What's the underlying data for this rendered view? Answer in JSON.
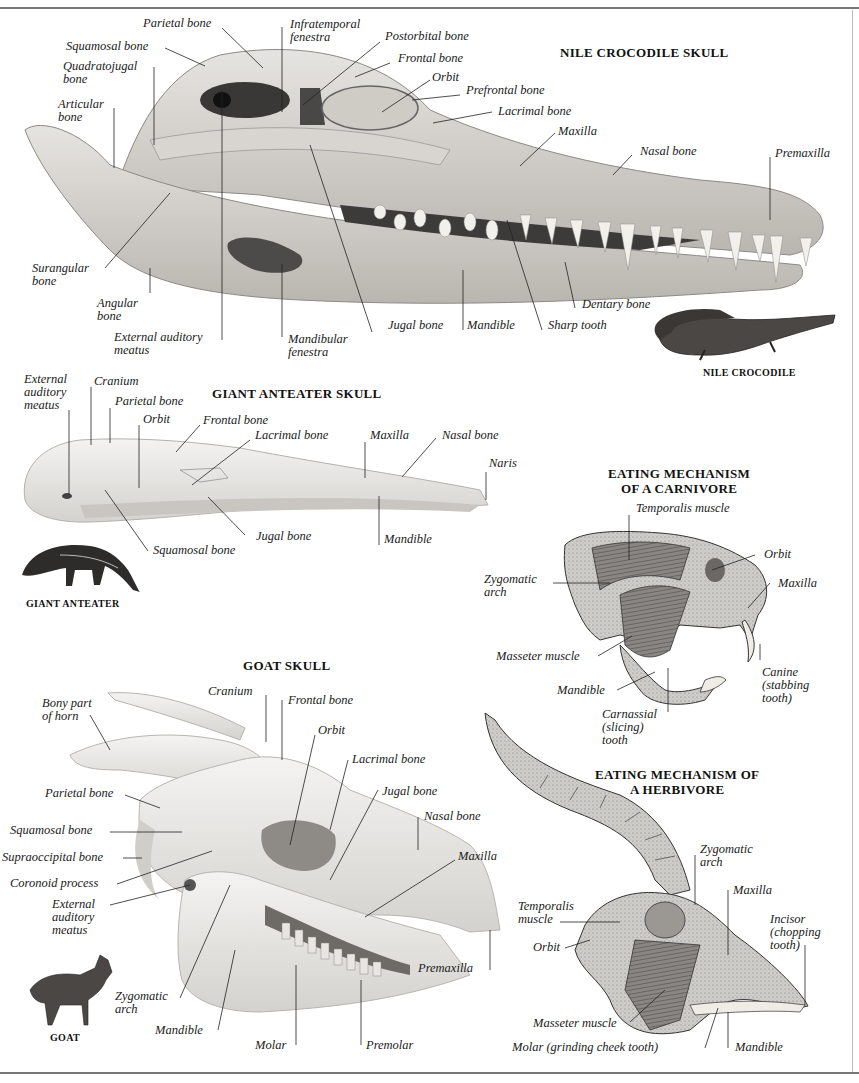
{
  "sections": {
    "crocodile": {
      "title": "NILE CROCODILE SKULL",
      "caption": "NILE CROCODILE",
      "labels": {
        "parietal": "Parietal bone",
        "squamosal": "Squamosal bone",
        "quadratojugal": "Quadratojugal\nbone",
        "articular": "Articular\nbone",
        "infratemporal": "Infratemporal\nfenestra",
        "postorbital": "Postorbital bone",
        "frontal": "Frontal bone",
        "orbit": "Orbit",
        "prefrontal": "Prefrontal bone",
        "lacrimal": "Lacrimal bone",
        "maxilla": "Maxilla",
        "nasal": "Nasal bone",
        "premaxilla": "Premaxilla",
        "surangular": "Surangular\nbone",
        "angular": "Angular\nbone",
        "ext_auditory": "External auditory\nmeatus",
        "mandibular_fenestra": "Mandibular\nfenestra",
        "jugal": "Jugal bone",
        "mandible": "Mandible",
        "sharp_tooth": "Sharp tooth",
        "dentary": "Dentary bone"
      }
    },
    "anteater": {
      "title": "GIANT ANTEATER SKULL",
      "caption": "GIANT ANTEATER",
      "labels": {
        "ext_auditory": "External\nauditory\nmeatus",
        "cranium": "Cranium",
        "parietal": "Parietal bone",
        "orbit": "Orbit",
        "frontal": "Frontal bone",
        "lacrimal": "Lacrimal bone",
        "maxilla": "Maxilla",
        "nasal": "Nasal bone",
        "naris": "Naris",
        "jugal": "Jugal bone",
        "squamosal": "Squamosal bone",
        "mandible": "Mandible"
      }
    },
    "carnivore": {
      "title": "EATING MECHANISM\nOF A CARNIVORE",
      "labels": {
        "temporalis": "Temporalis muscle",
        "orbit": "Orbit",
        "zygomatic": "Zygomatic\narch",
        "maxilla": "Maxilla",
        "masseter": "Masseter muscle",
        "mandible": "Mandible",
        "canine": "Canine\n(stabbing\ntooth)",
        "carnassial": "Carnassial\n(slicing)\ntooth"
      }
    },
    "goat": {
      "title": "GOAT SKULL",
      "caption": "GOAT",
      "labels": {
        "horn": "Bony part\nof horn",
        "cranium": "Cranium",
        "frontal": "Frontal bone",
        "orbit": "Orbit",
        "lacrimal": "Lacrimal bone",
        "parietal": "Parietal bone",
        "jugal": "Jugal bone",
        "squamosal": "Squamosal bone",
        "nasal": "Nasal bone",
        "supraoccipital": "Supraoccipital bone",
        "maxilla": "Maxilla",
        "coronoid": "Coronoid process",
        "ext_auditory": "External\nauditory\nmeatus",
        "premaxilla": "Premaxilla",
        "zygomatic": "Zygomatic\narch",
        "mandible": "Mandible",
        "molar": "Molar",
        "premolar": "Premolar"
      }
    },
    "herbivore": {
      "title": "EATING MECHANISM OF\nA HERBIVORE",
      "labels": {
        "zygomatic": "Zygomatic\narch",
        "maxilla": "Maxilla",
        "temporalis": "Temporalis\nmuscle",
        "incisor": "Incisor\n(chopping\ntooth)",
        "orbit": "Orbit",
        "masseter": "Masseter muscle",
        "molar": "Molar (grinding cheek tooth)",
        "mandible": "Mandible"
      }
    }
  },
  "colors": {
    "bone": "#dcdad6",
    "bone_dark": "#a9a6a0",
    "ink": "#1a1a1a",
    "frame": "#777777"
  }
}
